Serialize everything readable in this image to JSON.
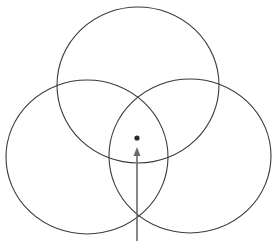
{
  "diagram": {
    "type": "three-circle-venn",
    "stroke_color": "#3a3a3a",
    "arrow_color": "#6a6a6a",
    "dot_color": "#2a2a2a",
    "background": "#ffffff",
    "circles": [
      {
        "name": "top",
        "cx": 138,
        "cy": 85,
        "rx": 81,
        "ry": 78
      },
      {
        "name": "left",
        "cx": 87,
        "cy": 157,
        "rx": 81,
        "ry": 77
      },
      {
        "name": "right",
        "cx": 190,
        "cy": 156,
        "rx": 81,
        "ry": 77
      }
    ],
    "center_dot": {
      "cx": 137,
      "cy": 138,
      "r": 2.6
    },
    "arrow": {
      "x": 137,
      "y_start": 241,
      "y_end": 147
    }
  }
}
